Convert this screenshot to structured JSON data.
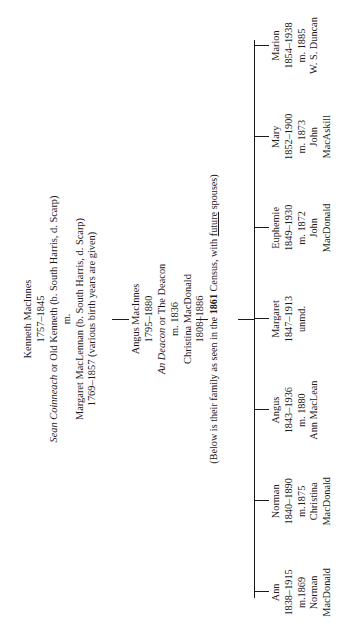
{
  "chart": {
    "type": "genealogy-tree",
    "orientation": "rotated-90-ccw"
  },
  "generation1": {
    "name": "Kenneth MacInnes",
    "dates": "1757–1845",
    "alias": "Sean Coinneach or Old Kenneth (b. South Harris, d. Scarp)",
    "marriage_mark": "m.",
    "spouse": "Margaret MacLennan (b. South Harris, d. Scarp)",
    "spouse_dates": "1769–1857 (various birth years are given)"
  },
  "generation2": {
    "name": "Angus MacInnes",
    "dates": "1795–1880",
    "alias": "An Deacon or The Deacon",
    "marriage": "m. 1836",
    "spouse": "Christina MacDonald",
    "spouse_dates": "1808–1886"
  },
  "census_note": {
    "prefix": "(Below is their family as seen in the ",
    "year": "1861",
    "middle": " Census, with ",
    "emphasis": "future",
    "suffix": " spouses)"
  },
  "children": [
    {
      "name": "Ann",
      "dates": "1838–1915",
      "marriage": "m.1869",
      "spouse_first": "Norman",
      "spouse_last": "MacDonald"
    },
    {
      "name": "Norman",
      "dates": "1840–1890",
      "marriage": "m.1875",
      "spouse_first": "Christina",
      "spouse_last": "MacDonald"
    },
    {
      "name": "Angus",
      "dates": "1843–1936",
      "marriage": "m. 1880",
      "spouse_first": "Ann MacLean",
      "spouse_last": ""
    },
    {
      "name": "Margaret",
      "dates": "1847–1913",
      "marriage": "unmd.",
      "spouse_first": "",
      "spouse_last": ""
    },
    {
      "name": "Euphemie",
      "dates": "1849–1930",
      "marriage": "m. 1872",
      "spouse_first": "John",
      "spouse_last": "MacDonald"
    },
    {
      "name": "Mary",
      "dates": "1852–1900",
      "marriage": "m. 1873",
      "spouse_first": "John",
      "spouse_last": "MacAskill"
    },
    {
      "name": "Marion",
      "dates": "1854–1938",
      "marriage": "m. 1885",
      "spouse_first": "W. S. Duncan",
      "spouse_last": ""
    }
  ],
  "colors": {
    "ink": "#1a1a1a",
    "paper": "#ffffff"
  }
}
